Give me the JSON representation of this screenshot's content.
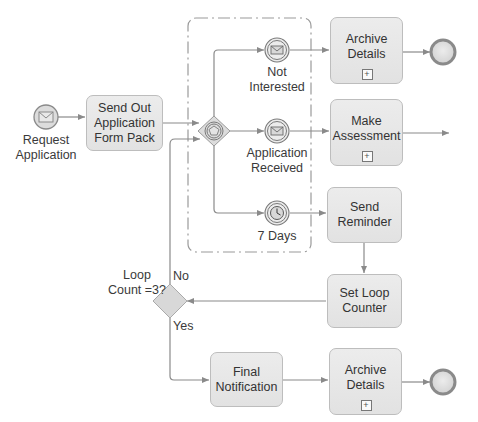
{
  "diagram": {
    "type": "BPMN process",
    "start_event": {
      "label": "Request\nApplication",
      "icon": "envelope-icon"
    },
    "tasks": [
      {
        "id": "send-out",
        "label": "Send Out\nApplication\nForm Pack",
        "subprocess": false
      },
      {
        "id": "archive-1",
        "label": "Archive\nDetails",
        "subprocess": true
      },
      {
        "id": "make-assessment",
        "label": "Make\nAssessment",
        "subprocess": true
      },
      {
        "id": "send-reminder",
        "label": "Send\nReminder",
        "subprocess": false
      },
      {
        "id": "set-loop-counter",
        "label": "Set Loop\nCounter",
        "subprocess": false
      },
      {
        "id": "final-notification",
        "label": "Final\nNotification",
        "subprocess": false
      },
      {
        "id": "archive-2",
        "label": "Archive\nDetails",
        "subprocess": true
      }
    ],
    "event_based_gateway": {
      "icon": "pentagon-icon"
    },
    "intermediate_events": [
      {
        "id": "not-interested",
        "label": "Not\nInterested",
        "icon": "envelope-icon"
      },
      {
        "id": "application-received",
        "label": "Application\nReceived",
        "icon": "envelope-icon"
      },
      {
        "id": "seven-days",
        "label": "7 Days",
        "icon": "clock-icon"
      }
    ],
    "decision_gateway": {
      "label": "Loop\nCount =3?",
      "no_label": "No",
      "yes_label": "Yes"
    },
    "expand_marker": "+",
    "colors": {
      "task_fill": "#e6e6e6",
      "task_border": "#bdbdbd",
      "line": "#8a8a8a",
      "end_border": "#8a8a8a",
      "group_dash": "#9a9a9a"
    }
  }
}
